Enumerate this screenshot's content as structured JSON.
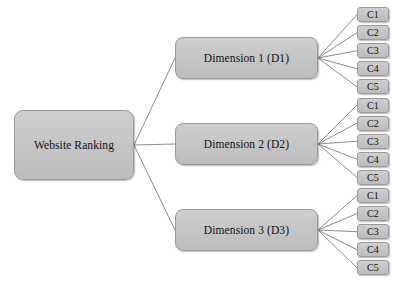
{
  "diagram": {
    "type": "hierarchy-tree",
    "orientation": "left-to-right",
    "colors": {
      "node_fill": "#c6c6c6",
      "node_border": "#9a9a9a",
      "edge": "#8c8c8c",
      "text": "#111111",
      "background": "#ffffff"
    },
    "root": {
      "label": "Website Ranking"
    },
    "dimensions": [
      {
        "label": "Dimension 1 (D1)",
        "criteria": [
          {
            "label": "C1"
          },
          {
            "label": "C2"
          },
          {
            "label": "C3"
          },
          {
            "label": "C4"
          },
          {
            "label": "C5"
          }
        ]
      },
      {
        "label": "Dimension 2 (D2)",
        "criteria": [
          {
            "label": "C1"
          },
          {
            "label": "C2"
          },
          {
            "label": "C3"
          },
          {
            "label": "C4"
          },
          {
            "label": "C5"
          }
        ]
      },
      {
        "label": "Dimension 3 (D3)",
        "criteria": [
          {
            "label": "C1"
          },
          {
            "label": "C2"
          },
          {
            "label": "C3"
          },
          {
            "label": "C4"
          },
          {
            "label": "C5"
          }
        ]
      }
    ]
  },
  "layout": {
    "root": {
      "x": 14,
      "y": 110,
      "w": 120,
      "h": 70
    },
    "dimension_x": 175,
    "dimension_w": 143,
    "dimension_h": 42,
    "dimension_y": [
      37,
      123,
      209
    ],
    "leaf_x": 357,
    "leaf_w": 32,
    "leaf_h": 15,
    "leaf_y_start": 7,
    "leaf_y_step": 18.1
  }
}
